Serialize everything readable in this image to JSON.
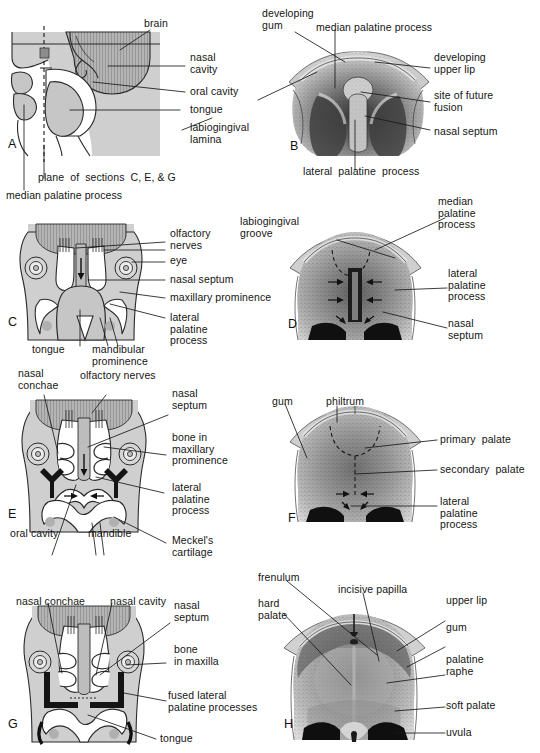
{
  "figure": {
    "panels": [
      {
        "id": "A",
        "letter": "A",
        "view": "sagittal section of embryonic head",
        "labels": [
          "brain",
          "nasal\ncavity",
          "oral cavity",
          "tongue",
          "labiogingival\nlamina",
          "plane of sections C, E, & G",
          "median palatine process"
        ]
      },
      {
        "id": "B",
        "letter": "B",
        "view": "inferior view of developing palate, early stage",
        "labels": [
          "developing\ngum",
          "median palatine process",
          "developing\nupper lip",
          "site of future\nfusion",
          "nasal septum",
          "lateral palatine process"
        ]
      },
      {
        "id": "C",
        "letter": "C",
        "view": "coronal section, early stage",
        "labels": [
          "olfactory\nnerves",
          "eye",
          "nasal septum",
          "maxillary prominence",
          "lateral\npalatine\nprocess",
          "tongue",
          "mandibular\nprominence"
        ]
      },
      {
        "id": "D",
        "letter": "D",
        "view": "inferior view, palatine shelves elevating",
        "labels": [
          "labiogingival\ngroove",
          "median\npalatine\nprocess",
          "lateral\npalatine\nprocess",
          "nasal\nseptum"
        ]
      },
      {
        "id": "E",
        "letter": "E",
        "view": "coronal section, shelves elevated",
        "labels": [
          "nasal\nconchae",
          "olfactory nerves",
          "nasal\nseptum",
          "bone in\nmaxillary\nprominence",
          "lateral\npalatine\nprocess",
          "oral cavity",
          "mandible",
          "Meckel's\ncartilage"
        ]
      },
      {
        "id": "F",
        "letter": "F",
        "view": "inferior view, fusion of palate",
        "labels": [
          "gum",
          "philtrum",
          "primary palate",
          "secondary palate",
          "lateral\npalatine\nprocess"
        ]
      },
      {
        "id": "G",
        "letter": "G",
        "view": "coronal section, palate fused",
        "labels": [
          "nasal conchae",
          "nasal cavity",
          "nasal\nseptum",
          "bone\nin maxilla",
          "fused lateral\npalatine processes",
          "tongue"
        ]
      },
      {
        "id": "H",
        "letter": "H",
        "view": "inferior view of mature palate",
        "labels": [
          "frenulum",
          "incisive papilla",
          "hard\npalate",
          "upper lip",
          "gum",
          "palatine\nraphe",
          "soft palate",
          "uvula"
        ]
      }
    ]
  },
  "panelA": {
    "letter": "A",
    "brain": "brain",
    "nasal_cavity": "nasal\ncavity",
    "oral_cavity": "oral cavity",
    "tongue": "tongue",
    "labiogingival_lamina": "labiogingival\nlamina",
    "plane": "plane  of  sections  C, E, & G",
    "median_palatine_process": "median palatine process"
  },
  "panelB": {
    "letter": "B",
    "developing_gum": "developing\ngum",
    "median_palatine_process": "median palatine process",
    "developing_upper_lip": "developing\nupper lip",
    "site_of_future_fusion": "site of future\nfusion",
    "nasal_septum": "nasal septum",
    "lateral_palatine_process": "lateral  palatine  process"
  },
  "panelC": {
    "letter": "C",
    "olfactory_nerves": "olfactory\nnerves",
    "eye": "eye",
    "nasal_septum": "nasal septum",
    "maxillary_prominence": "maxillary prominence",
    "lateral_palatine_process": "lateral\npalatine\nprocess",
    "tongue": "tongue",
    "mandibular_prominence": "mandibular\nprominence"
  },
  "panelD": {
    "letter": "D",
    "labiogingival_groove": "labiogingival\ngroove",
    "median_palatine_process": "median\npalatine\nprocess",
    "lateral_palatine_process": "lateral\npalatine\nprocess",
    "nasal_septum": "nasal\nseptum"
  },
  "panelE": {
    "letter": "E",
    "nasal_conchae": "nasal\nconchae",
    "olfactory_nerves": "olfactory nerves",
    "nasal_septum": "nasal\nseptum",
    "bone_in_maxillary_prominence": "bone in\nmaxillary\nprominence",
    "lateral_palatine_process": "lateral\npalatine\nprocess",
    "oral_cavity": "oral cavity",
    "mandible": "mandible",
    "meckels_cartilage": "Meckel's\ncartilage"
  },
  "panelF": {
    "letter": "F",
    "gum": "gum",
    "philtrum": "philtrum",
    "primary_palate": "primary  palate",
    "secondary_palate": "secondary  palate",
    "lateral_palatine_process": "lateral\npalatine\nprocess"
  },
  "panelG": {
    "letter": "G",
    "nasal_conchae": "nasal conchae",
    "nasal_cavity": "nasal cavity",
    "nasal_septum": "nasal\nseptum",
    "bone_in_maxilla": "bone\nin maxilla",
    "fused_lateral_palatine_processes": "fused lateral\npalatine processes",
    "tongue": "tongue"
  },
  "panelH": {
    "letter": "H",
    "frenulum": "frenulum",
    "incisive_papilla": "incisive papilla",
    "hard_palate": "hard\npalate",
    "upper_lip": "upper lip",
    "gum": "gum",
    "palatine_raphe": "palatine\nraphe",
    "soft_palate": "soft palate",
    "uvula": "uvula"
  },
  "colors": {
    "tissue": "#cfcfcf",
    "brain": "#9b9b9b",
    "bone": "#141414",
    "cavity": "#ffffff",
    "ink": "#141414",
    "background": "#ffffff"
  }
}
